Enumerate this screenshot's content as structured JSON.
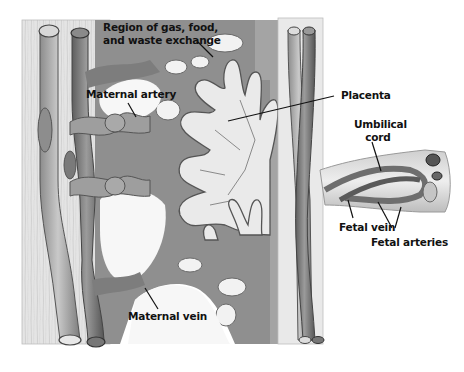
{
  "diagram": {
    "labels": {
      "region_exchange_line1": "Region of gas, food,",
      "region_exchange_line2": "and waste exchange",
      "maternal_artery": "Maternal artery",
      "placenta": "Placenta",
      "umbilical_cord_line1": "Umbilical",
      "umbilical_cord_line2": "cord",
      "fetal_vein": "Fetal vein",
      "fetal_arteries": "Fetal arteries",
      "maternal_vein": "Maternal vein"
    },
    "colors": {
      "background": "#ffffff",
      "tissue_light": "#e6e6e6",
      "tissue_mid": "#9a9a9a",
      "tissue_dark": "#6e6e6e",
      "vessel_light": "#b8b8b8",
      "vessel_dark": "#7a7a7a",
      "outline": "#3a3a3a",
      "label_text": "#111111"
    }
  }
}
